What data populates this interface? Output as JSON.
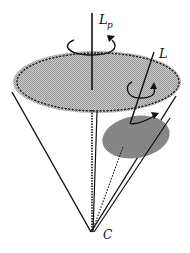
{
  "diagram": {
    "labels": {
      "precession_axis": "L",
      "precession_axis_sub": "p",
      "angular_momentum": "L",
      "apex": "C"
    },
    "colors": {
      "large_disk": "#b9b9b9",
      "small_disk": "#8d8d8d",
      "line": "#111111"
    },
    "icons": {
      "precession_rotation": "circular-arrow-icon",
      "spin_rotation": "circular-arrow-icon"
    }
  }
}
